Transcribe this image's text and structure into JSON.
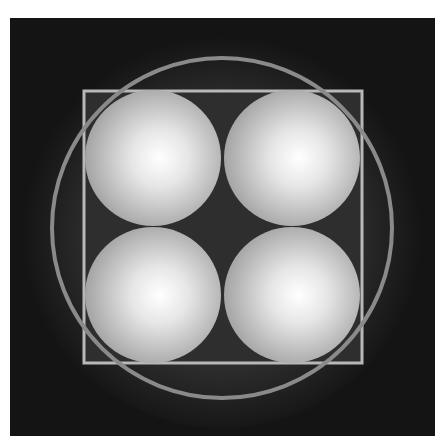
{
  "figure": {
    "background": {
      "x": 10,
      "y": 18,
      "w": 425,
      "h": 418,
      "color": "#141414"
    },
    "square": {
      "x": 84,
      "y": 91,
      "w": 278,
      "h": 272,
      "stroke": "#b8b8b8",
      "fill": "#2e2e2e"
    },
    "circle": {
      "cx": 222,
      "cy": 228,
      "r": 170,
      "stroke": "#8a8a8a"
    },
    "spheres": [
      {
        "name": "top-left",
        "cx": 153,
        "cy": 158,
        "r": 68
      },
      {
        "name": "top-right",
        "cx": 292,
        "cy": 158,
        "r": 68
      },
      {
        "name": "bottom-left",
        "cx": 153,
        "cy": 295,
        "r": 68
      },
      {
        "name": "bottom-right",
        "cx": 292,
        "cy": 295,
        "r": 68
      }
    ],
    "colors": {
      "sphere_center": "#ffffff",
      "sphere_edge": "#9a9a9a",
      "glow": "#5a5a5a"
    }
  }
}
